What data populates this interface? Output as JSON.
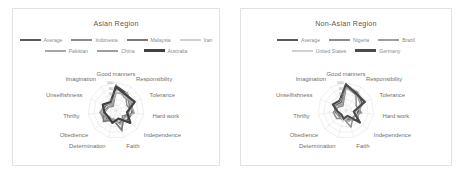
{
  "figure": {
    "background": "#ffffff",
    "panel_border": "#e2e2e2"
  },
  "panels": [
    {
      "id": "asian",
      "title": "Asian Region",
      "chart_data": {
        "type": "radar",
        "title": "Asian Region",
        "categories": [
          "Good manners",
          "Responsibility",
          "Tolerance",
          "Hard work",
          "Independence",
          "Faith",
          "Determination",
          "Obedience",
          "Thrifty",
          "Unselfishness",
          "Imagination"
        ],
        "rlim": [
          0,
          100
        ],
        "ticks": [
          20,
          40,
          60,
          80,
          100
        ],
        "tick_labels": [
          "20",
          "40",
          "60",
          "80",
          "100"
        ],
        "grid": true,
        "legend_position": "top",
        "series": [
          {
            "name": "Average",
            "color": "#595959",
            "width": 2.0,
            "values": [
              88,
              72,
              60,
              58,
              53,
              44,
              42,
              45,
              50,
              40,
              32
            ]
          },
          {
            "name": "Indonesia",
            "color": "#8c8c8c",
            "width": 1.5,
            "values": [
              82,
              63,
              43,
              64,
              30,
              76,
              34,
              55,
              56,
              30,
              18
            ]
          },
          {
            "name": "Malaysia",
            "color": "#7a7a7a",
            "width": 1.5,
            "values": [
              77,
              70,
              52,
              48,
              38,
              72,
              36,
              60,
              44,
              33,
              22
            ]
          },
          {
            "name": "Iran",
            "color": "#d0d0d0",
            "width": 1.2,
            "values": [
              70,
              58,
              66,
              50,
              44,
              40,
              48,
              38,
              52,
              36,
              26
            ]
          },
          {
            "name": "Pakistan",
            "color": "#a6a6a6",
            "width": 1.5,
            "values": [
              62,
              75,
              58,
              66,
              40,
              52,
              30,
              50,
              40,
              28,
              24
            ]
          },
          {
            "name": "China",
            "color": "#9e9e9e",
            "width": 1.5,
            "values": [
              92,
              55,
              70,
              42,
              62,
              34,
              38,
              32,
              58,
              46,
              30
            ]
          },
          {
            "name": "Australia",
            "color": "#404040",
            "width": 2.2,
            "values": [
              85,
              66,
              74,
              40,
              68,
              30,
              46,
              36,
              42,
              52,
              36
            ]
          }
        ]
      }
    },
    {
      "id": "non-asian",
      "title": "Non-Asian Region",
      "chart_data": {
        "type": "radar",
        "title": "Non-Asian Region",
        "categories": [
          "Good manners",
          "Responsibility",
          "Tolerance",
          "Hard work",
          "Independence",
          "Faith",
          "Determination",
          "Obedience",
          "Thrifty",
          "Unselfishness",
          "Imagination"
        ],
        "rlim": [
          0,
          100
        ],
        "ticks": [
          20,
          40,
          60,
          80,
          100
        ],
        "tick_labels": [
          "20",
          "40",
          "60",
          "80",
          "100"
        ],
        "grid": true,
        "legend_position": "top",
        "series": [
          {
            "name": "Average",
            "color": "#595959",
            "width": 2.0,
            "values": [
              90,
              76,
              64,
              42,
              54,
              30,
              36,
              30,
              38,
              44,
              34
            ]
          },
          {
            "name": "Nigeria",
            "color": "#8c8c8c",
            "width": 1.5,
            "values": [
              84,
              66,
              40,
              56,
              34,
              62,
              30,
              44,
              46,
              30,
              20
            ]
          },
          {
            "name": "Brazil",
            "color": "#9e9e9e",
            "width": 1.5,
            "values": [
              80,
              72,
              56,
              50,
              38,
              40,
              32,
              34,
              36,
              40,
              26
            ]
          },
          {
            "name": "United States",
            "color": "#d0d0d0",
            "width": 1.2,
            "values": [
              92,
              80,
              68,
              36,
              60,
              26,
              40,
              24,
              32,
              48,
              38
            ]
          },
          {
            "name": "Germany",
            "color": "#4a4a4a",
            "width": 2.2,
            "values": [
              94,
              70,
              74,
              28,
              66,
              20,
              30,
              22,
              30,
              52,
              42
            ]
          }
        ]
      }
    }
  ]
}
